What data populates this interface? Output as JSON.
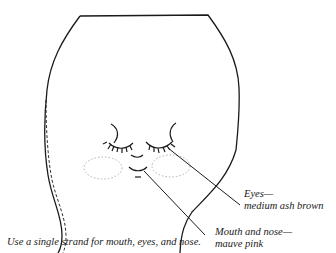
{
  "diagram": {
    "type": "embroidery face pattern",
    "labels": {
      "eyes_line1": "Eyes—",
      "eyes_line2": "medium ash brown",
      "mouth_line1": "Mouth and nose—",
      "mouth_line2": "mauve pink",
      "caption": "Use a single strand for mouth, eyes, and nose."
    },
    "colors": {
      "stroke": "#1a1a1a",
      "cheek_dots": "#b0b0b0"
    }
  }
}
